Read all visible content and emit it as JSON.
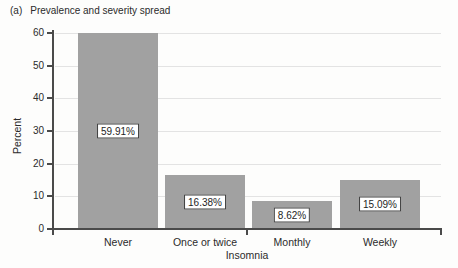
{
  "figure": {
    "panel_label": "(a)",
    "title": "Prevalence and severity spread"
  },
  "chart_data": {
    "type": "bar",
    "categories": [
      "Never",
      "Once or twice",
      "Monthly",
      "Weekly"
    ],
    "values": [
      59.91,
      16.38,
      8.62,
      15.09
    ],
    "value_labels": [
      "59.91%",
      "16.38%",
      "8.62%",
      "15.09%"
    ],
    "xlabel": "Insomnia",
    "ylabel": "Percent",
    "ylim": [
      0,
      60
    ],
    "yticks": [
      0,
      10,
      20,
      30,
      40,
      50,
      60
    ],
    "grid": "horizontal",
    "legend": "none",
    "bar_color": "#a1a1a1",
    "grid_color": "#e3e3e3",
    "axis_color": "#4a4a4a",
    "value_box_bg": "#ffffff"
  }
}
